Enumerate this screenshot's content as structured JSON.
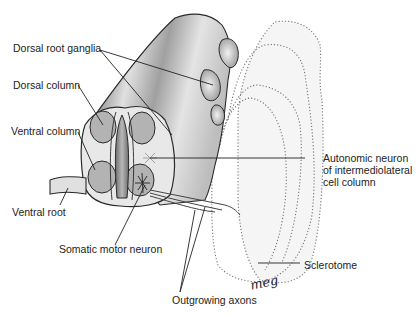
{
  "figure": {
    "type": "anatomical-illustration",
    "colors": {
      "tissue_dark": "#8a8a8a",
      "tissue_light": "#e8e8e8",
      "column_fill": "#b0b0b0",
      "outline": "#2a2a2a",
      "sclerotome_fill": "#f4f4f4",
      "dotted_outline": "#777777"
    }
  },
  "labels": {
    "dorsal_root_ganglia": "Dorsal root ganglia",
    "dorsal_column": "Dorsal column",
    "ventral_column": "Ventral column",
    "ventral_root": "Ventral root",
    "somatic_motor_neuron": "Somatic motor neuron",
    "autonomic_neuron": "Autonomic neuron\nof intermediolateral\ncell column",
    "sclerotome": "Sclerotome",
    "outgrowing_axons": "Outgrowing axons",
    "artist_signature": "meg"
  }
}
